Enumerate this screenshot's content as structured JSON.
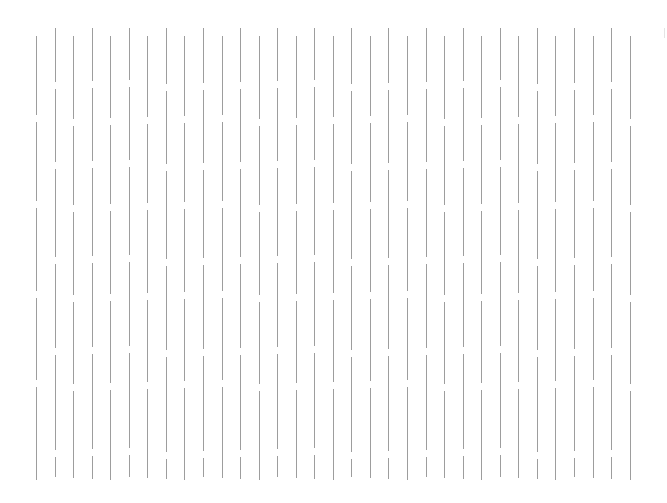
{
  "canvas": {
    "width": 667,
    "height": 503,
    "background": "#ffffff"
  },
  "pattern": {
    "type": "vertical-dashed-lines",
    "line_color": "#8c8c8c",
    "line_width": 1,
    "first_x": 36,
    "spacing": 18.55,
    "count": 33,
    "top": 28,
    "bottom": 480,
    "gap_height": 7,
    "phase_a": {
      "start_y": 36,
      "gaps_y": [
        117,
        203,
        293,
        382
      ]
    },
    "phase_b": {
      "start_y": 28,
      "gaps_y": [
        82,
        162,
        257,
        348,
        450
      ]
    }
  }
}
